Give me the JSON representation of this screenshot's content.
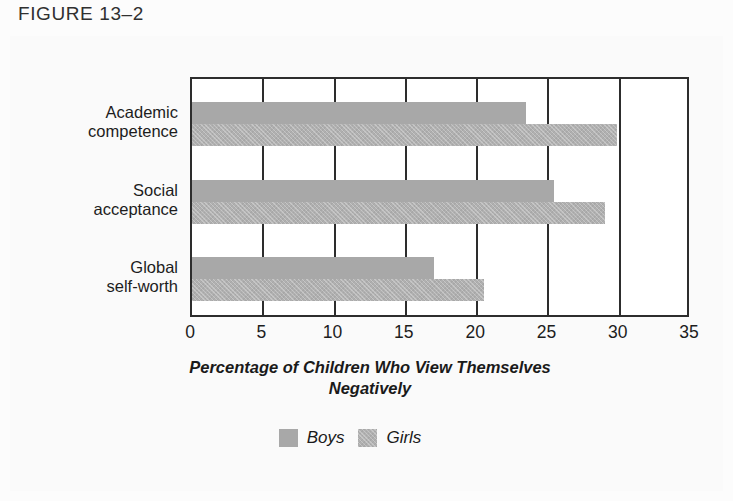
{
  "figure": {
    "label": "FIGURE 13–2"
  },
  "chart_data": {
    "type": "bar",
    "orientation": "horizontal",
    "title": "",
    "xlabel": "Percentage of Children Who View Themselves Negatively",
    "ylabel": "",
    "xlim": [
      0,
      35
    ],
    "xticks": [
      0,
      5,
      10,
      15,
      20,
      25,
      30,
      35
    ],
    "xtick_labels": [
      "0",
      "5",
      "10",
      "15",
      "20",
      "25",
      "30",
      "35"
    ],
    "grid": true,
    "grid_axis": "x",
    "legend_position": "bottom-center",
    "categories": [
      "Academic competence",
      "Social acceptance",
      "Global self-worth"
    ],
    "category_lines": [
      [
        "Academic",
        "competence"
      ],
      [
        "Social",
        "acceptance"
      ],
      [
        "Global",
        "self-worth"
      ]
    ],
    "series": [
      {
        "name": "Boys",
        "color": "#a8a8a8",
        "values": [
          23.4,
          25.4,
          17.0
        ]
      },
      {
        "name": "Girls",
        "color": "#b0b0b0",
        "values": [
          29.8,
          29.0,
          20.5
        ]
      }
    ]
  },
  "legend": {
    "items": [
      {
        "label": "Boys",
        "swatch": "#a8a8a8"
      },
      {
        "label": "Girls",
        "swatch": "#b0b0b0"
      }
    ]
  },
  "colors": {
    "axis": "#2d2d2d",
    "text": "#1d1d1d",
    "plot_background": "#ffffff",
    "page_background": "#fafafa"
  }
}
